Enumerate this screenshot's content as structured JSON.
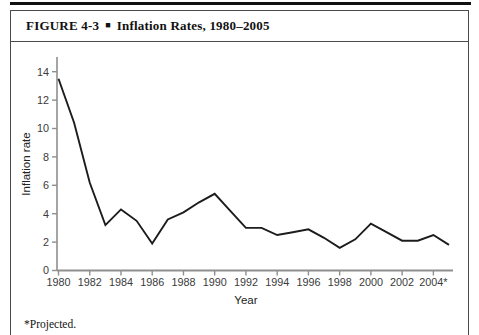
{
  "figure": {
    "label": "FIGURE 4-3",
    "bullet": "■",
    "title": "Inflation Rates, 1980–2005"
  },
  "footnote": "*Projected.",
  "chart_data": {
    "type": "line",
    "title": "Inflation Rates, 1980–2005",
    "xlabel": "Year",
    "ylabel": "Inflation rate",
    "x": [
      1980,
      1981,
      1982,
      1983,
      1984,
      1985,
      1986,
      1987,
      1988,
      1989,
      1990,
      1991,
      1992,
      1993,
      1994,
      1995,
      1996,
      1997,
      1998,
      1999,
      2000,
      2001,
      2002,
      2003,
      2004,
      2005
    ],
    "values": [
      13.5,
      10.4,
      6.2,
      3.2,
      4.3,
      3.5,
      1.9,
      3.6,
      4.1,
      4.8,
      5.4,
      4.2,
      3.0,
      3.0,
      2.5,
      2.7,
      2.9,
      2.3,
      1.6,
      2.2,
      3.3,
      2.7,
      2.1,
      2.1,
      2.5,
      1.8
    ],
    "xtick_years": [
      1980,
      1982,
      1984,
      1986,
      1988,
      1990,
      1992,
      1994,
      1996,
      1998,
      2000,
      2002,
      2004
    ],
    "xtick_labels": [
      "1980",
      "1982",
      "1984",
      "1986",
      "1988",
      "1990",
      "1992",
      "1994",
      "1996",
      "1998",
      "2000",
      "2002",
      "2004*"
    ],
    "yticks": [
      0,
      2,
      4,
      6,
      8,
      10,
      12,
      14
    ],
    "ylim": [
      0,
      14
    ],
    "xlim": [
      1980,
      2005.3
    ],
    "grid": false,
    "legend": "none",
    "last_point_note": "2005 value is projected",
    "line_color": "#1c1c1c",
    "axis_color": "#8f8f8f"
  }
}
